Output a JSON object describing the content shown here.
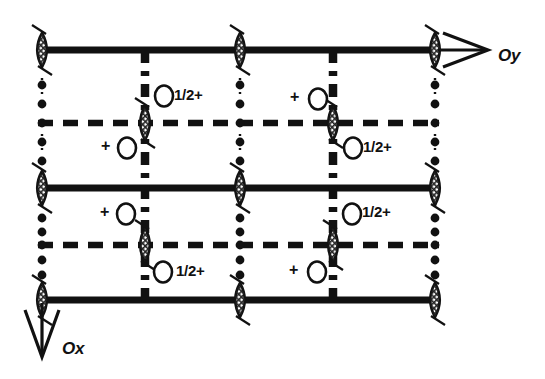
{
  "figure": {
    "kind": "space-group-symmetry-diagram",
    "background": "#ffffff",
    "ink": "#111111",
    "width": 545,
    "height": 379
  },
  "axes": {
    "y_axis": {
      "label": "Oy",
      "direction": "right",
      "x": 498,
      "y": 57
    },
    "x_axis": {
      "label": "Ox",
      "direction": "down",
      "x": 62,
      "y": 350
    }
  },
  "grid": {
    "columns_x": [
      42,
      145,
      240,
      333,
      435
    ],
    "rows_y": [
      50,
      123,
      188,
      245,
      300
    ],
    "column_styles": [
      "dotted",
      "dashdot",
      "dotted",
      "dashdot",
      "dotted"
    ],
    "row_styles": [
      "solid",
      "dashed",
      "solid",
      "dashed",
      "solid"
    ]
  },
  "symbols": {
    "lens_label": "two-fold-rotation-axis",
    "dot_label": "two-fold-screw-axis",
    "open_circle_label": "general-position-circle",
    "tick_label": "inversion-tick"
  },
  "lenses": [
    {
      "x": 42,
      "y": 50,
      "tick": true
    },
    {
      "x": 240,
      "y": 50,
      "tick": true
    },
    {
      "x": 435,
      "y": 50,
      "tick": true
    },
    {
      "x": 145,
      "y": 123,
      "tick": true
    },
    {
      "x": 333,
      "y": 123,
      "tick": true
    },
    {
      "x": 42,
      "y": 188,
      "tick": true
    },
    {
      "x": 240,
      "y": 188,
      "tick": true
    },
    {
      "x": 435,
      "y": 188,
      "tick": true
    },
    {
      "x": 145,
      "y": 245,
      "tick": true
    },
    {
      "x": 333,
      "y": 245,
      "tick": true
    },
    {
      "x": 42,
      "y": 300,
      "tick": true
    },
    {
      "x": 240,
      "y": 300,
      "tick": true
    },
    {
      "x": 435,
      "y": 300,
      "tick": true
    }
  ],
  "screw_dots": [
    {
      "x": 42,
      "y": 85
    },
    {
      "x": 42,
      "y": 104
    },
    {
      "x": 42,
      "y": 123
    },
    {
      "x": 42,
      "y": 142
    },
    {
      "x": 42,
      "y": 161
    },
    {
      "x": 42,
      "y": 218
    },
    {
      "x": 42,
      "y": 232
    },
    {
      "x": 42,
      "y": 245
    },
    {
      "x": 42,
      "y": 260
    },
    {
      "x": 42,
      "y": 275
    },
    {
      "x": 240,
      "y": 85
    },
    {
      "x": 240,
      "y": 104
    },
    {
      "x": 240,
      "y": 123
    },
    {
      "x": 240,
      "y": 142
    },
    {
      "x": 240,
      "y": 161
    },
    {
      "x": 240,
      "y": 218
    },
    {
      "x": 240,
      "y": 232
    },
    {
      "x": 240,
      "y": 245
    },
    {
      "x": 240,
      "y": 260
    },
    {
      "x": 240,
      "y": 275
    },
    {
      "x": 435,
      "y": 85
    },
    {
      "x": 435,
      "y": 104
    },
    {
      "x": 435,
      "y": 123
    },
    {
      "x": 435,
      "y": 142
    },
    {
      "x": 435,
      "y": 161
    },
    {
      "x": 435,
      "y": 218
    },
    {
      "x": 435,
      "y": 232
    },
    {
      "x": 435,
      "y": 245
    },
    {
      "x": 435,
      "y": 260
    },
    {
      "x": 435,
      "y": 275
    }
  ],
  "positions": [
    {
      "id": "p1",
      "circle_x": 164,
      "circle_y": 96,
      "text": "1/2+",
      "text_x": 174,
      "text_y": 86,
      "order": "circle-then-text"
    },
    {
      "id": "p2",
      "circle_x": 318,
      "circle_y": 99,
      "text": "+",
      "text_x": 290,
      "text_y": 88,
      "order": "text-then-circle"
    },
    {
      "id": "p3",
      "circle_x": 127,
      "circle_y": 148,
      "text": "+",
      "text_x": 101,
      "text_y": 137,
      "order": "text-then-circle"
    },
    {
      "id": "p4",
      "circle_x": 353,
      "circle_y": 148,
      "text": "1/2+",
      "text_x": 363,
      "text_y": 138,
      "order": "circle-then-text"
    },
    {
      "id": "p5",
      "circle_x": 126,
      "circle_y": 214,
      "text": "+",
      "text_x": 100,
      "text_y": 203,
      "order": "text-then-circle"
    },
    {
      "id": "p6",
      "circle_x": 352,
      "circle_y": 214,
      "text": "1/2+",
      "text_x": 362,
      "text_y": 203,
      "order": "circle-then-text"
    },
    {
      "id": "p7",
      "circle_x": 163,
      "circle_y": 272,
      "text": "1/2+",
      "text_x": 176,
      "text_y": 262,
      "order": "circle-then-text"
    },
    {
      "id": "p8",
      "circle_x": 317,
      "circle_y": 272,
      "text": "+",
      "text_x": 289,
      "text_y": 261,
      "order": "text-then-circle"
    }
  ],
  "glide_marks": {
    "description": "thick dash-dot vertical axial glide traces",
    "columns_x": [
      145,
      333
    ]
  }
}
